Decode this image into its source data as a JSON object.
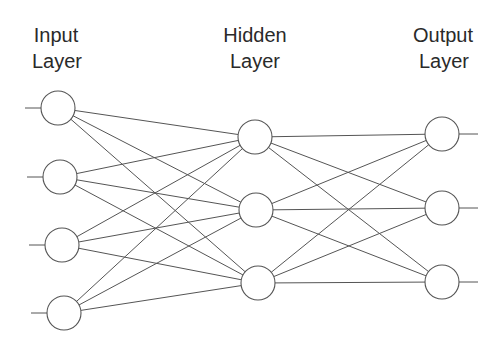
{
  "diagram": {
    "type": "feedforward-neural-network",
    "layers": [
      {
        "id": "input",
        "label_line1": "Input",
        "label_line2": "Layer",
        "node_count": 4
      },
      {
        "id": "hidden",
        "label_line1": "Hidden",
        "label_line2": "Layer",
        "node_count": 3
      },
      {
        "id": "output",
        "label_line1": "Output",
        "label_line2": "Layer",
        "node_count": 3
      }
    ],
    "connectivity": "fully-connected",
    "has_input_leads": true,
    "has_output_leads": true,
    "colors": {
      "stroke": "#555555",
      "text": "#2a2a2a",
      "background": "#ffffff"
    }
  }
}
